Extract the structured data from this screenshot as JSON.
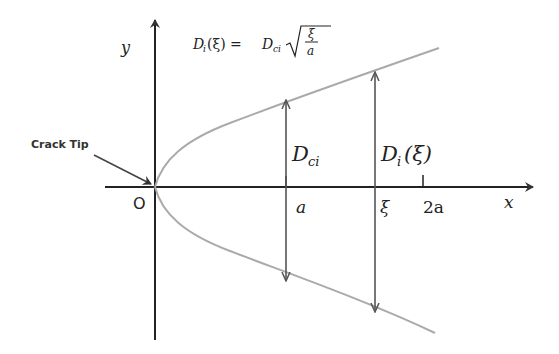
{
  "diagram": {
    "formula": {
      "lhs": "D",
      "lhs_sub": "i",
      "lhs_arg": "(ξ) = ",
      "rhs": "D",
      "rhs_sub": "ci",
      "frac_num": "ξ",
      "frac_den": "a"
    },
    "axes": {
      "x_label": "x",
      "y_label": "y",
      "origin_label": "O"
    },
    "ticks": {
      "a": "a",
      "xi": "ξ",
      "two_a": "2a"
    },
    "dimensions": {
      "dci_main": "D",
      "dci_sub": "ci",
      "di_main": "D",
      "di_sub": "i",
      "di_arg": "(ξ)"
    },
    "annotation": {
      "crack_tip": "Crack Tip"
    },
    "colors": {
      "axis": "#222222",
      "curve": "#aaaaaa",
      "arrow": "#555555"
    }
  }
}
